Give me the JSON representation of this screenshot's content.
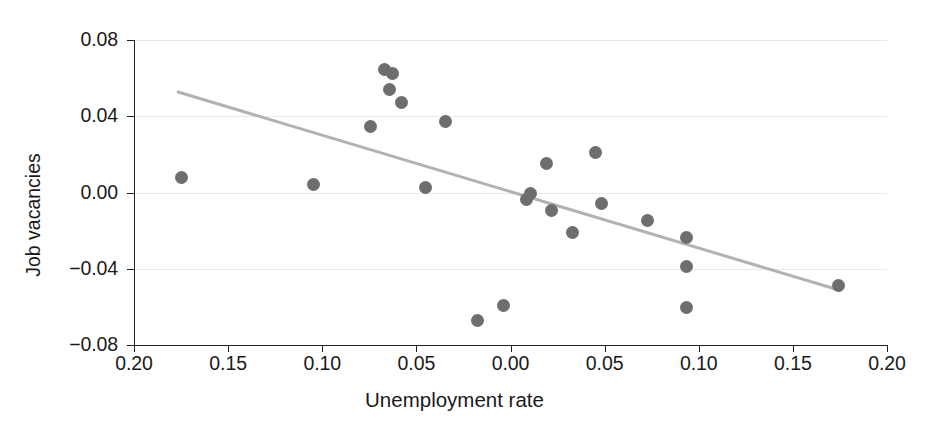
{
  "chart_data": {
    "type": "scatter",
    "title": "",
    "subtitle": "",
    "xlabel": "Unemployment rate",
    "ylabel": "Job vacancies",
    "grid": true,
    "legend": false,
    "x_axis_reversed_left_half": true,
    "xlim": [
      -0.2,
      0.2
    ],
    "ylim": [
      -0.08,
      0.08
    ],
    "xticks": [
      -0.2,
      -0.15,
      -0.1,
      -0.05,
      0.0,
      0.05,
      0.1,
      0.15,
      0.2
    ],
    "xtick_labels": [
      "0.20",
      "0.15",
      "0.10",
      "0.05",
      "0.00",
      "0.05",
      "0.10",
      "0.15",
      "0.20"
    ],
    "yticks": [
      0.08,
      0.04,
      0.0,
      -0.04,
      -0.08
    ],
    "ytick_labels": [
      "0.08",
      "0.04",
      "0.00",
      "−0.04",
      "−0.08"
    ],
    "marker_color": "#6e6e6e",
    "marker_size_px": 13,
    "line_color": "#b2b2b2",
    "grid_color": "#e9e9e9",
    "axis_color": "#1f1f1f",
    "points": [
      {
        "x": -0.175,
        "y": 0.008
      },
      {
        "x": -0.1048,
        "y": 0.0043
      },
      {
        "x": -0.0745,
        "y": 0.0345
      },
      {
        "x": -0.067,
        "y": 0.0645
      },
      {
        "x": -0.0643,
        "y": 0.0542
      },
      {
        "x": -0.0627,
        "y": 0.0625
      },
      {
        "x": -0.058,
        "y": 0.047
      },
      {
        "x": -0.0452,
        "y": 0.0025
      },
      {
        "x": -0.0346,
        "y": 0.0375
      },
      {
        "x": -0.0173,
        "y": -0.067
      },
      {
        "x": -0.0037,
        "y": -0.059
      },
      {
        "x": 0.0085,
        "y": -0.0035
      },
      {
        "x": 0.0106,
        "y": -0.0005
      },
      {
        "x": 0.0191,
        "y": 0.0155
      },
      {
        "x": 0.0218,
        "y": -0.0095
      },
      {
        "x": 0.033,
        "y": -0.0208
      },
      {
        "x": 0.0452,
        "y": 0.0212
      },
      {
        "x": 0.0484,
        "y": -0.0055
      },
      {
        "x": 0.0729,
        "y": -0.0148
      },
      {
        "x": 0.0936,
        "y": -0.0236
      },
      {
        "x": 0.0936,
        "y": -0.039
      },
      {
        "x": 0.0936,
        "y": -0.0605
      },
      {
        "x": 0.1744,
        "y": -0.0488
      }
    ],
    "trend_line": {
      "type": "linear-fit",
      "x_start": -0.1766,
      "y_start": 0.0527,
      "x_end": 0.1749,
      "y_end": -0.0513
    }
  },
  "axes": {
    "y_title": "Job vacancies",
    "x_title": "Unemployment rate"
  }
}
